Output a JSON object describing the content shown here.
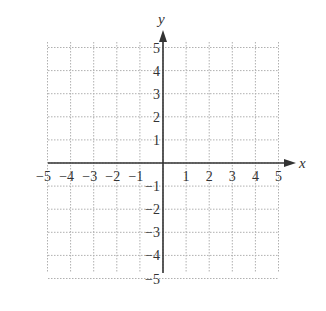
{
  "chart_data": {
    "type": "scatter",
    "title": "",
    "xlabel": "x",
    "ylabel": "y",
    "xlim": [
      -5,
      5
    ],
    "ylim": [
      -5,
      5
    ],
    "grid": true,
    "grid_style": "dotted",
    "x_ticks": [
      -5,
      -4,
      -3,
      -2,
      -1,
      1,
      2,
      3,
      4,
      5
    ],
    "y_ticks": [
      -5,
      -4,
      -3,
      -2,
      -1,
      1,
      2,
      3,
      4,
      5
    ],
    "x_tick_labels": [
      "−5",
      "−4",
      "−3",
      "−2",
      "−1",
      "1",
      "2",
      "3",
      "4",
      "5"
    ],
    "y_tick_labels": [
      "−5",
      "−4",
      "−3",
      "−2",
      "−1",
      "1",
      "2",
      "3",
      "4",
      "5"
    ],
    "series": [],
    "legend": null
  },
  "colors": {
    "axis": "#333333",
    "grid": "#b0b0b0",
    "text": "#333333"
  }
}
